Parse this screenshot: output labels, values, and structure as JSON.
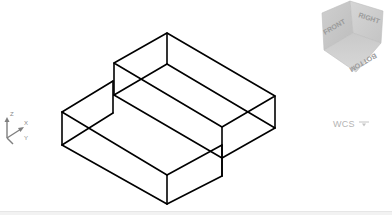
{
  "viewport": {
    "background": "#ffffff",
    "model": {
      "type": "wireframe",
      "stroke_color": "#000000",
      "description": "Stepped isometric solid (two stacked boxes)"
    }
  },
  "viewcube": {
    "faces": {
      "top": "",
      "front": "FRONT",
      "right": "RIGHT",
      "bottom": "BOTTOM"
    },
    "color": "#c8c8c8"
  },
  "ucs_icon": {
    "axes": {
      "x": "X",
      "y": "Y",
      "z": "Z"
    }
  },
  "wcs_menu": {
    "label": "WCS",
    "icon": "chevron-down-icon"
  }
}
